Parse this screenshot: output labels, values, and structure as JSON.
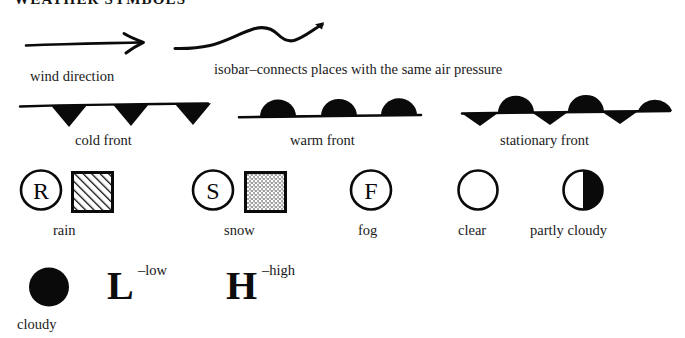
{
  "title": "WEATHER SYMBOLS",
  "background_color": "#ffffff",
  "ink_color": "#000000",
  "row_lines": {
    "wind_direction": {
      "label": "wind direction",
      "icon": "arrow-right-icon"
    },
    "isobar": {
      "label": "isobar–connects places with the same air pressure",
      "icon": "wavy-line-icon"
    }
  },
  "fronts": [
    {
      "id": "cold",
      "label": "cold front",
      "icon": "cold-front-icon",
      "marker": "triangle-below",
      "count": 3
    },
    {
      "id": "warm",
      "label": "warm front",
      "icon": "warm-front-icon",
      "marker": "semicircle-above",
      "count": 3
    },
    {
      "id": "stationary",
      "label": "stationary front",
      "icon": "stationary-front-icon",
      "marker": "alternating-semicircle-triangle",
      "count": 6
    }
  ],
  "conditions": [
    {
      "id": "rain",
      "label": "rain",
      "circle_letter": "R",
      "swatch": "hatched",
      "icons": [
        "circled-letter-r-icon",
        "hatched-square-icon"
      ]
    },
    {
      "id": "snow",
      "label": "snow",
      "circle_letter": "S",
      "swatch": "stippled",
      "icons": [
        "circled-letter-s-icon",
        "stippled-square-icon"
      ]
    },
    {
      "id": "fog",
      "label": "fog",
      "circle_letter": "F",
      "swatch": "none",
      "icons": [
        "circled-letter-f-icon"
      ]
    },
    {
      "id": "clear",
      "label": "clear",
      "circle_letter": "",
      "swatch": "none",
      "icons": [
        "empty-circle-icon"
      ]
    },
    {
      "id": "partly-cloudy",
      "label": "partly cloudy",
      "circle_letter": "",
      "swatch": "none",
      "icons": [
        "half-filled-circle-icon"
      ]
    }
  ],
  "bottom_row": {
    "cloudy": {
      "label": "cloudy",
      "icon": "filled-circle-icon"
    },
    "low": {
      "letter": "L",
      "annotation": "–low"
    },
    "high": {
      "letter": "H",
      "annotation": "–high"
    }
  }
}
